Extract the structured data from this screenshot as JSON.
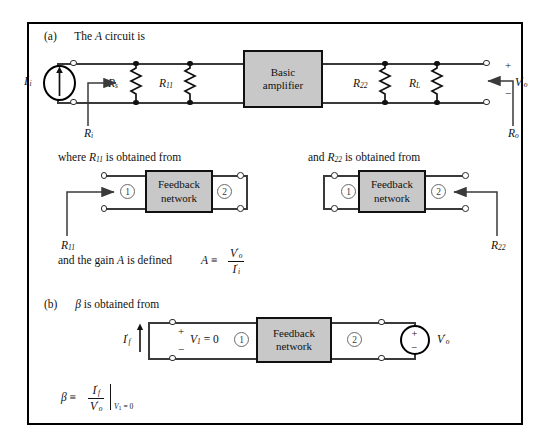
{
  "figure": {
    "panel_a": {
      "label": "(a)",
      "text_before": "The",
      "italic_var": "A",
      "text_after": "circuit is",
      "source_label_base": "I",
      "source_label_sub": "i",
      "source_label_prime": "′",
      "input_resistance": {
        "base": "R",
        "sub": "i"
      },
      "output_resistance": {
        "base": "R",
        "sub": "o"
      },
      "output_voltage": {
        "base": "V",
        "sub": "o",
        "prime": "′"
      },
      "plus_sign": "+",
      "minus_sign": "−",
      "amplifier_line1": "Basic",
      "amplifier_line2": "amplifier",
      "resistors": [
        {
          "base": "R",
          "sub": "s"
        },
        {
          "base": "R",
          "sub": "11"
        },
        {
          "base": "R",
          "sub": "22"
        },
        {
          "base": "R",
          "sub": "L"
        }
      ]
    },
    "mid": {
      "left_caption_pre": "where",
      "left_caption_var_base": "R",
      "left_caption_var_sub": "11",
      "left_caption_post": "is obtained from",
      "right_caption_pre": "and",
      "right_caption_var_base": "R",
      "right_caption_var_sub": "22",
      "right_caption_post": "is obtained from",
      "feedback_line1": "Feedback",
      "feedback_line2": "network",
      "port1": "1",
      "port2": "2",
      "pointer_left": {
        "base": "R",
        "sub": "11"
      },
      "pointer_right": {
        "base": "R",
        "sub": "22"
      }
    },
    "gain": {
      "text": "and the gain",
      "var": "A",
      "text2": "is defined",
      "def_lhs": "A",
      "equiv": "≡",
      "numerator_base": "V",
      "numerator_sub": "o",
      "numerator_prime": "′",
      "denominator_base": "I",
      "denominator_sub": "i",
      "denominator_prime": "′"
    },
    "panel_b": {
      "label": "(b)",
      "beta": "β",
      "text": "is obtained from",
      "current_base": "I",
      "current_sub": "f",
      "current_prime": "′",
      "plus_sign": "+",
      "minus_sign": "−",
      "v1_base": "V",
      "v1_sub": "1",
      "v1_equals": "= 0",
      "feedback_line1": "Feedback",
      "feedback_line2": "network",
      "port1": "1",
      "port2": "2",
      "source_plus": "+",
      "source_minus": "−",
      "source_label_base": "V",
      "source_label_sub": "o",
      "source_label_prime": "′"
    },
    "beta_def": {
      "lhs": "β",
      "equiv": "≡",
      "numerator_base": "I",
      "numerator_sub": "f",
      "numerator_prime": "′",
      "denominator_base": "V",
      "denominator_sub": "o",
      "denominator_prime": "′",
      "condition_base": "V",
      "condition_sub": "1",
      "condition_rest": "= 0"
    },
    "colors": {
      "box_fill": "#c8c8c8",
      "wire": "#3a3a3a",
      "ink": "#111111",
      "border": "#000000"
    }
  }
}
